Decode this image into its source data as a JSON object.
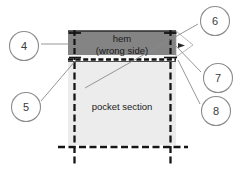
{
  "diagram": {
    "regions": {
      "hem": {
        "label": "hem",
        "sublabel": "(wrong side)",
        "fill": "#848484"
      },
      "pocket": {
        "label": "pocket section",
        "fill": "#ececec"
      }
    },
    "callouts": [
      {
        "id": "callout-4",
        "number": "4",
        "cx": 24,
        "cy": 46
      },
      {
        "id": "callout-5",
        "number": "5",
        "cx": 26,
        "cy": 107
      },
      {
        "id": "callout-6",
        "number": "6",
        "cx": 215,
        "cy": 21
      },
      {
        "id": "callout-7",
        "number": "7",
        "cx": 218,
        "cy": 78
      },
      {
        "id": "callout-8",
        "number": "8",
        "cx": 216,
        "cy": 111
      }
    ],
    "colors": {
      "ink": "#1a1a1a",
      "callout_stroke": "#8c8c8c",
      "leader": "#7a7a7a",
      "stitch": "#111111",
      "hem_fill": "#848484",
      "pocket_fill": "#ececec",
      "background": "#ffffff"
    }
  }
}
